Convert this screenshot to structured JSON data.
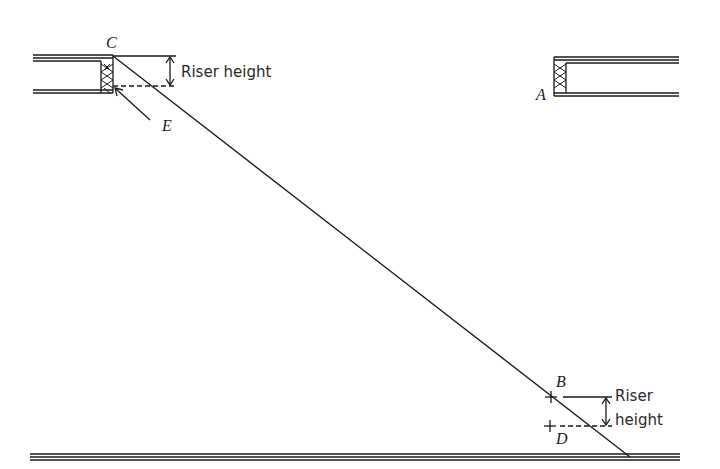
{
  "diagram": {
    "type": "stair-opening-layout",
    "points": {
      "A": "A",
      "B": "B",
      "C": "C",
      "D": "D",
      "E": "E"
    },
    "annotations": {
      "upper_riser": "Riser height",
      "lower_riser_line1": "Riser",
      "lower_riser_line2": "height"
    },
    "colors": {
      "ink": "#1a1a1a",
      "background": "#ffffff"
    }
  }
}
